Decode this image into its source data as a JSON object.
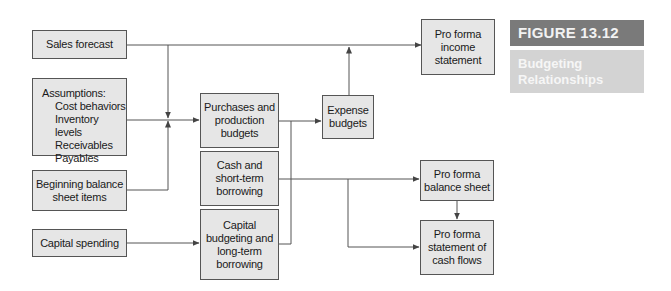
{
  "figure": {
    "number_label": "FIGURE 13.12",
    "title": "Budgeting\nRelationships",
    "header_color": "#7a7a7a",
    "title_band_color": "#d3d3d3"
  },
  "diagram": {
    "inputs": {
      "sales_forecast": "Sales forecast",
      "assumptions": {
        "heading": "Assumptions:",
        "items": [
          "Cost behaviors",
          "Inventory levels",
          "Receivables",
          "Payables"
        ]
      },
      "beginning_balance": "Beginning balance\nsheet items",
      "capital_spending": "Capital spending"
    },
    "budgets": {
      "purchases_production": "Purchases and\nproduction\nbudgets",
      "cash_borrowing": "Cash and\nshort-term\nborrowing",
      "capital_budgeting": "Capital\nbudgeting and\nlong-term\nborrowing",
      "expense": "Expense\nbudgets"
    },
    "outputs": {
      "income_statement": "Pro forma\nincome\nstatement",
      "balance_sheet": "Pro forma\nbalance sheet",
      "cash_flows": "Pro forma\nstatement of\ncash flows"
    },
    "box_fill": "#e6e6e6",
    "line_color": "#555555"
  }
}
